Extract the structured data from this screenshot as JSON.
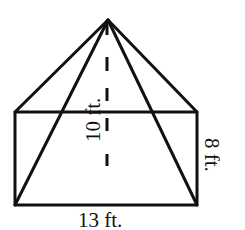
{
  "diagram": {
    "labels": {
      "height": "10 ft.",
      "prism_height": "8 ft.",
      "base_width": "13 ft."
    },
    "colors": {
      "stroke": "#111111",
      "background": "#ffffff"
    }
  }
}
